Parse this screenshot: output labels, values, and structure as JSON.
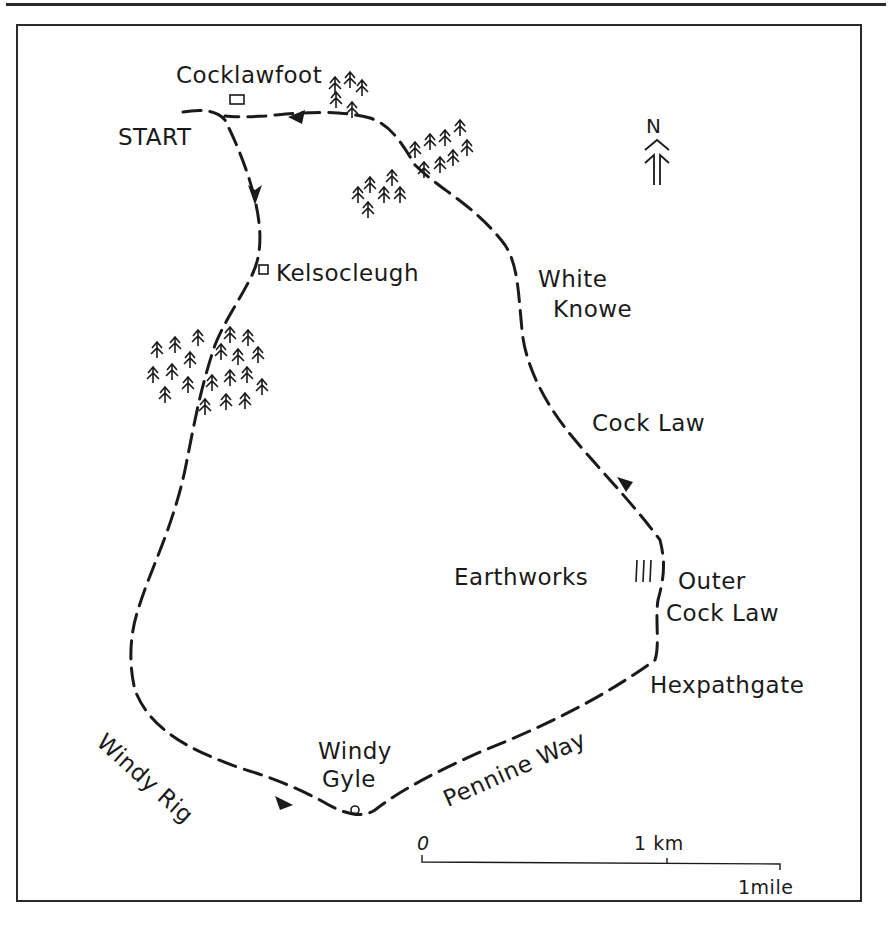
{
  "map": {
    "labels": {
      "start": "START",
      "cocklawfoot": "Cocklawfoot",
      "kelsocleugh": "Kelsocleugh",
      "white_knowe_1": "White",
      "white_knowe_2": "Knowe",
      "cock_law": "Cock Law",
      "earthworks": "Earthworks",
      "outer_cock_law_1": "Outer",
      "outer_cock_law_2": "Cock Law",
      "hexpathgate": "Hexpathgate",
      "windy_gyle_1": "Windy",
      "windy_gyle_2": "Gyle",
      "windy_rig": "Windy Rig",
      "pennine_way": "Pennine Way"
    },
    "north_arrow": {
      "label": "N",
      "icon": "north-arrow-icon"
    },
    "scale_bar": {
      "zero": "0",
      "km": "1 km",
      "mile": "1mile"
    },
    "symbols": [
      "building-icon",
      "forest-icon",
      "summit-icon",
      "earthworks-icon",
      "direction-arrow-icon"
    ],
    "colors": {
      "ink": "#1a1a1a",
      "paper": "#ffffff"
    }
  }
}
